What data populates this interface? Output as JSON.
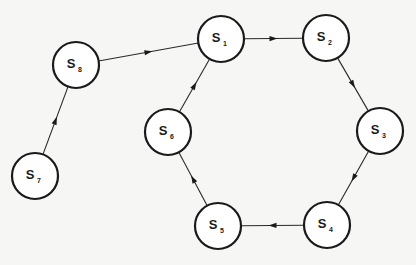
{
  "diagram": {
    "type": "directed-cycle-graph",
    "node_radius": 23,
    "nodes": [
      {
        "id": "S1",
        "label": "S",
        "sub": "1",
        "x": 221,
        "y": 39
      },
      {
        "id": "S2",
        "label": "S",
        "sub": "2",
        "x": 326,
        "y": 38
      },
      {
        "id": "S3",
        "label": "S",
        "sub": "3",
        "x": 380,
        "y": 131
      },
      {
        "id": "S4",
        "label": "S",
        "sub": "4",
        "x": 327,
        "y": 225
      },
      {
        "id": "S5",
        "label": "S",
        "sub": "5",
        "x": 218,
        "y": 226
      },
      {
        "id": "S6",
        "label": "S",
        "sub": "6",
        "x": 168,
        "y": 132
      },
      {
        "id": "S7",
        "label": "S",
        "sub": "7",
        "x": 35,
        "y": 176
      },
      {
        "id": "S8",
        "label": "S",
        "sub": "8",
        "x": 76,
        "y": 65
      }
    ],
    "edges": [
      {
        "from": "S7",
        "to": "S8"
      },
      {
        "from": "S8",
        "to": "S1"
      },
      {
        "from": "S1",
        "to": "S2"
      },
      {
        "from": "S2",
        "to": "S3"
      },
      {
        "from": "S3",
        "to": "S4"
      },
      {
        "from": "S4",
        "to": "S5"
      },
      {
        "from": "S5",
        "to": "S6"
      },
      {
        "from": "S6",
        "to": "S1"
      }
    ]
  }
}
